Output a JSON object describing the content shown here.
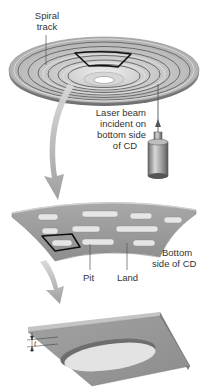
{
  "figure": {
    "colors": {
      "disc_light": "#e4e4e4",
      "disc_mid": "#b9b9b9",
      "disc_dark": "#8a8a8a",
      "groove": "#5f5f5f",
      "highlight_outline": "#111111",
      "strip_fill": "#9c9c9c",
      "pit_fill": "#e6e6e6",
      "arrow_fill": "#a9a9a9",
      "label_text": "#333333"
    }
  },
  "labels": {
    "spiral_track": [
      "Spiral",
      "track"
    ],
    "laser": [
      "Laser beam",
      "incident on",
      "bottom side",
      "of CD"
    ],
    "pit": "Pit",
    "land": "Land",
    "bottom_side": [
      "Bottom",
      "side of CD"
    ],
    "pit_depth": "t"
  }
}
